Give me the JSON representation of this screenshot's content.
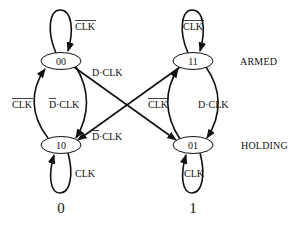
{
  "diagram": {
    "type": "state-machine",
    "states": [
      {
        "id": "00",
        "label": "00"
      },
      {
        "id": "11",
        "label": "11"
      },
      {
        "id": "10",
        "label": "10"
      },
      {
        "id": "01",
        "label": "01"
      }
    ],
    "row_labels": {
      "armed": "ARMED",
      "holding": "HOLDING"
    },
    "column_labels": {
      "left": "0",
      "right": "1"
    },
    "transitions": [
      {
        "from": "00",
        "to": "00",
        "label_main": "CLK",
        "label_overline": "CLK",
        "note": "self-loop, CLK negated"
      },
      {
        "from": "11",
        "to": "11",
        "label_main": "CLK",
        "label_overline": "CLK",
        "note": "self-loop, CLK negated"
      },
      {
        "from": "10",
        "to": "10",
        "label": "CLK"
      },
      {
        "from": "01",
        "to": "01",
        "label": "CLK"
      },
      {
        "from": "10",
        "to": "00",
        "label_overline": "CLK",
        "note": "CLK negated"
      },
      {
        "from": "00",
        "to": "10",
        "label_prefix_overline": "D",
        "label_suffix": "·CLK",
        "note": "D negated · CLK"
      },
      {
        "from": "00",
        "to": "01",
        "label": "D·CLK"
      },
      {
        "from": "11",
        "to": "10",
        "label_prefix_overline": "D",
        "label_suffix": "·CLK",
        "note": "D negated · CLK"
      },
      {
        "from": "01",
        "to": "11",
        "label_overline": "CLK",
        "note": "CLK negated"
      },
      {
        "from": "11",
        "to": "01",
        "label": "D·CLK"
      }
    ],
    "edge_labels": {
      "loop00": "CLK",
      "loop11": "CLK",
      "loop10": "CLK",
      "loop01": "CLK",
      "left_up": "CLK",
      "left_down_d": "D",
      "left_down_rest": "·CLK",
      "cross_down": "D·CLK",
      "cross_up_d": "D",
      "cross_up_rest": "·CLK",
      "right_up": "CLK",
      "right_down": "D·CLK"
    }
  }
}
